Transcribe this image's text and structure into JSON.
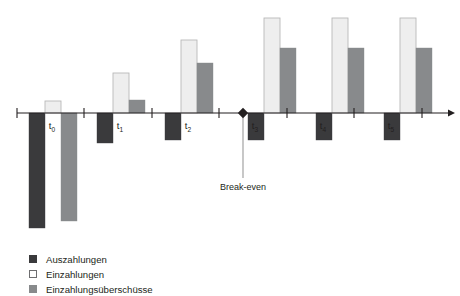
{
  "chart_data": {
    "type": "bar",
    "title": "",
    "subtitle": "",
    "xlabel": "",
    "ylabel": "",
    "categories": [
      "t0",
      "t1",
      "t2",
      "t3",
      "t4",
      "t5"
    ],
    "category_labels": [
      {
        "base": "t",
        "sub": "0"
      },
      {
        "base": "t",
        "sub": "1"
      },
      {
        "base": "t",
        "sub": "2"
      },
      {
        "base": "t",
        "sub": "3"
      },
      {
        "base": "t",
        "sub": "4"
      },
      {
        "base": "t",
        "sub": "5"
      }
    ],
    "series": [
      {
        "name": "Auszahlungen",
        "color": "#3a3a3c",
        "values": [
          -115,
          -30,
          -27,
          -27,
          -27,
          -27
        ]
      },
      {
        "name": "Einzahlungen",
        "color": "#eeeeee",
        "values": [
          12,
          40,
          73,
          95,
          95,
          95
        ]
      },
      {
        "name": "Einzahlungsüberschüsse",
        "color": "#888a8c",
        "values": [
          -108,
          13,
          50,
          65,
          65,
          65
        ]
      }
    ],
    "ylim": [
      -120,
      100
    ],
    "grid": false,
    "legend_position": "bottom-left",
    "annotations": [
      {
        "label": "Break-even",
        "x_position": 243,
        "marker": "diamond",
        "between_categories": [
          "t2",
          "t3"
        ]
      }
    ]
  },
  "chart": {
    "axis": {
      "y": 113,
      "x_start": 17,
      "x_end": 448,
      "arrow": true
    },
    "ticks": [
      17,
      84,
      152,
      219,
      287,
      354,
      422
    ],
    "groups": [
      {
        "label_base": "t",
        "label_sub": "0",
        "label_x": 52,
        "bars": [
          {
            "series": "Auszahlungen",
            "x": 29,
            "w": 16,
            "top": 113,
            "height": 115,
            "direction": "down"
          },
          {
            "series": "Einzahlungen",
            "x": 45,
            "w": 16,
            "top": 101,
            "height": 12,
            "direction": "up"
          },
          {
            "series": "Einzahlungsüberschüsse",
            "x": 61,
            "w": 16,
            "top": 113,
            "height": 108,
            "direction": "down"
          }
        ]
      },
      {
        "label_base": "t",
        "label_sub": "1",
        "label_x": 120,
        "bars": [
          {
            "series": "Auszahlungen",
            "x": 97,
            "w": 16,
            "top": 113,
            "height": 30,
            "direction": "down"
          },
          {
            "series": "Einzahlungen",
            "x": 113,
            "w": 16,
            "top": 73,
            "height": 40,
            "direction": "up"
          },
          {
            "series": "Einzahlungsüberschüsse",
            "x": 129,
            "w": 16,
            "top": 100,
            "height": 13,
            "direction": "up"
          }
        ]
      },
      {
        "label_base": "t",
        "label_sub": "2",
        "label_x": 188,
        "bars": [
          {
            "series": "Auszahlungen",
            "x": 165,
            "w": 16,
            "top": 113,
            "height": 27,
            "direction": "down"
          },
          {
            "series": "Einzahlungen",
            "x": 181,
            "w": 16,
            "top": 40,
            "height": 73,
            "direction": "up"
          },
          {
            "series": "Einzahlungsüberschüsse",
            "x": 197,
            "w": 16,
            "top": 63,
            "height": 50,
            "direction": "up"
          }
        ]
      },
      {
        "label_base": "t",
        "label_sub": "3",
        "label_x": 255,
        "bars": [
          {
            "series": "Auszahlungen",
            "x": 248,
            "w": 16,
            "top": 113,
            "height": 27,
            "direction": "down"
          },
          {
            "series": "Einzahlungen",
            "x": 264,
            "w": 16,
            "top": 18,
            "height": 95,
            "direction": "up"
          },
          {
            "series": "Einzahlungsüberschüsse",
            "x": 280,
            "w": 16,
            "top": 48,
            "height": 65,
            "direction": "up"
          }
        ]
      },
      {
        "label_base": "t",
        "label_sub": "4",
        "label_x": 323,
        "bars": [
          {
            "series": "Auszahlungen",
            "x": 316,
            "w": 16,
            "top": 113,
            "height": 27,
            "direction": "down"
          },
          {
            "series": "Einzahlungen",
            "x": 332,
            "w": 16,
            "top": 18,
            "height": 95,
            "direction": "up"
          },
          {
            "series": "Einzahlungsüberschüsse",
            "x": 348,
            "w": 16,
            "top": 48,
            "height": 65,
            "direction": "up"
          }
        ]
      },
      {
        "label_base": "t",
        "label_sub": "5",
        "label_x": 391,
        "bars": [
          {
            "series": "Auszahlungen",
            "x": 384,
            "w": 16,
            "top": 113,
            "height": 27,
            "direction": "down"
          },
          {
            "series": "Einzahlungen",
            "x": 400,
            "w": 16,
            "top": 18,
            "height": 95,
            "direction": "up"
          },
          {
            "series": "Einzahlungsüberschüsse",
            "x": 416,
            "w": 16,
            "top": 48,
            "height": 65,
            "direction": "up"
          }
        ]
      }
    ],
    "breakeven": {
      "label": "Break-even",
      "x": 243,
      "y": 113,
      "line_end_y": 178,
      "label_x": 243,
      "label_y": 190
    }
  },
  "legend": {
    "items": [
      {
        "label": "Auszahlungen",
        "swatch": "filled-dark",
        "color": "#3a3a3c"
      },
      {
        "label": "Einzahlungen",
        "swatch": "outlined-white",
        "color": "#ffffff"
      },
      {
        "label": "Einzahlungsüberschüsse",
        "swatch": "filled-gray",
        "color": "#888a8c"
      }
    ]
  }
}
